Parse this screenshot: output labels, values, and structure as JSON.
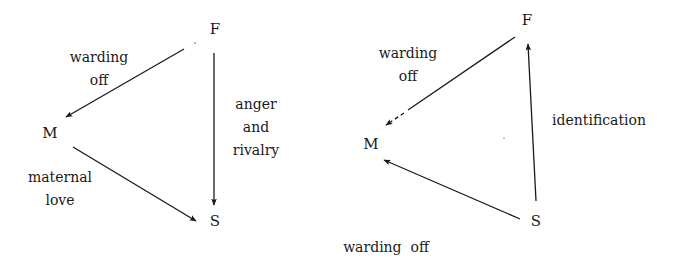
{
  "diagrams": [
    {
      "id": "left",
      "nodes": {
        "F": {
          "label": "F",
          "x": 215,
          "y": 29
        },
        "M": {
          "label": "M",
          "x": 50,
          "y": 133
        },
        "S": {
          "label": "S",
          "x": 215,
          "y": 221
        }
      },
      "edges": [
        {
          "from": "F",
          "to": "M",
          "label_lines": [
            "warding",
            "off"
          ],
          "style": "solid"
        },
        {
          "from": "F",
          "to": "S",
          "label_lines": [
            "anger",
            "and",
            "rivalry"
          ],
          "style": "solid"
        },
        {
          "from": "M",
          "to": "S",
          "label_lines": [
            "maternal",
            "love"
          ],
          "style": "solid"
        }
      ]
    },
    {
      "id": "right",
      "nodes": {
        "F": {
          "label": "F",
          "x": 527,
          "y": 20
        },
        "M": {
          "label": "M",
          "x": 371,
          "y": 144
        },
        "S": {
          "label": "S",
          "x": 536,
          "y": 221
        }
      },
      "edges": [
        {
          "from": "F",
          "to": "M",
          "label_lines": [
            "warding",
            "off"
          ],
          "style": "partially-dashed"
        },
        {
          "from": "S",
          "to": "F",
          "label_lines": [
            "identification"
          ],
          "style": "solid"
        },
        {
          "from": "S",
          "to": "M",
          "label_lines": [
            "warding  off"
          ],
          "style": "solid"
        }
      ]
    }
  ],
  "text": {
    "left_F": "F",
    "left_M": "M",
    "left_S": "S",
    "left_fm_label_1": "warding",
    "left_fm_label_2": "off",
    "left_fs_label_1": "anger",
    "left_fs_label_2": "and",
    "left_fs_label_3": "rivalry",
    "left_ms_label_1": "maternal",
    "left_ms_label_2": "love",
    "right_F": "F",
    "right_M": "M",
    "right_S": "S",
    "right_fm_label_1": "warding",
    "right_fm_label_2": "off",
    "right_sf_label": "identification",
    "right_sm_label": "warding  off"
  },
  "colors": {
    "ink": "#1a1a1a",
    "background": "#ffffff"
  }
}
